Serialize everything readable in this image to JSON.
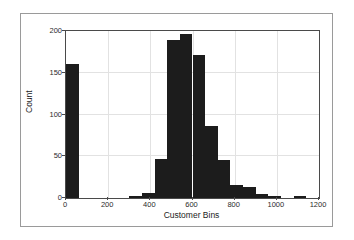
{
  "figure": {
    "background": "#ffffff",
    "frame_color": "#9a9a9a",
    "axes_color": "#4a4a4a",
    "bar_color": "#1c1c1c",
    "grid_color": "#e2e2e2"
  },
  "chart_data": {
    "type": "bar",
    "title": "",
    "xlabel": "Customer Bins",
    "ylabel": "Count",
    "xlim": [
      0,
      1200
    ],
    "ylim": [
      0,
      200
    ],
    "grid": true,
    "legend": null,
    "bin_width": 60,
    "xticks": [
      0,
      200,
      400,
      600,
      800,
      1000,
      1200
    ],
    "xtick_labels": [
      "0",
      "200",
      "400",
      "600",
      "800",
      "1000",
      "1200"
    ],
    "yticks": [
      0,
      50,
      100,
      150,
      200
    ],
    "ytick_labels": [
      "0",
      "50",
      "100",
      "150",
      "200"
    ],
    "bins": [
      {
        "left": 0,
        "right": 60,
        "count": 161
      },
      {
        "left": 60,
        "right": 120,
        "count": 0
      },
      {
        "left": 120,
        "right": 180,
        "count": 0
      },
      {
        "left": 180,
        "right": 240,
        "count": 0
      },
      {
        "left": 240,
        "right": 300,
        "count": 0
      },
      {
        "left": 300,
        "right": 360,
        "count": 2
      },
      {
        "left": 360,
        "right": 420,
        "count": 6
      },
      {
        "left": 420,
        "right": 480,
        "count": 47
      },
      {
        "left": 480,
        "right": 540,
        "count": 189
      },
      {
        "left": 540,
        "right": 600,
        "count": 197
      },
      {
        "left": 600,
        "right": 660,
        "count": 171
      },
      {
        "left": 660,
        "right": 720,
        "count": 86
      },
      {
        "left": 720,
        "right": 780,
        "count": 46
      },
      {
        "left": 780,
        "right": 840,
        "count": 15
      },
      {
        "left": 840,
        "right": 900,
        "count": 13
      },
      {
        "left": 900,
        "right": 960,
        "count": 5
      },
      {
        "left": 960,
        "right": 1020,
        "count": 2
      },
      {
        "left": 1020,
        "right": 1080,
        "count": 0
      },
      {
        "left": 1080,
        "right": 1140,
        "count": 3
      },
      {
        "left": 1140,
        "right": 1200,
        "count": 0
      }
    ]
  }
}
